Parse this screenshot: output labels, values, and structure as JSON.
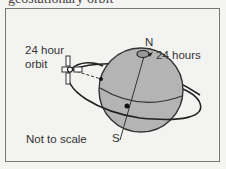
{
  "title_cropped": "geostationary orbit",
  "diagram": {
    "orbit_label_line1": "24 hour",
    "orbit_label_line2": "orbit",
    "north_label": "N",
    "rotation_label": "24 hours",
    "south_label": "S",
    "note": "Not to scale"
  },
  "colors": {
    "globe_fill": "#b4b4b4",
    "stroke": "#222222",
    "frame_border": "#777777",
    "background": "#f3f3f1"
  }
}
